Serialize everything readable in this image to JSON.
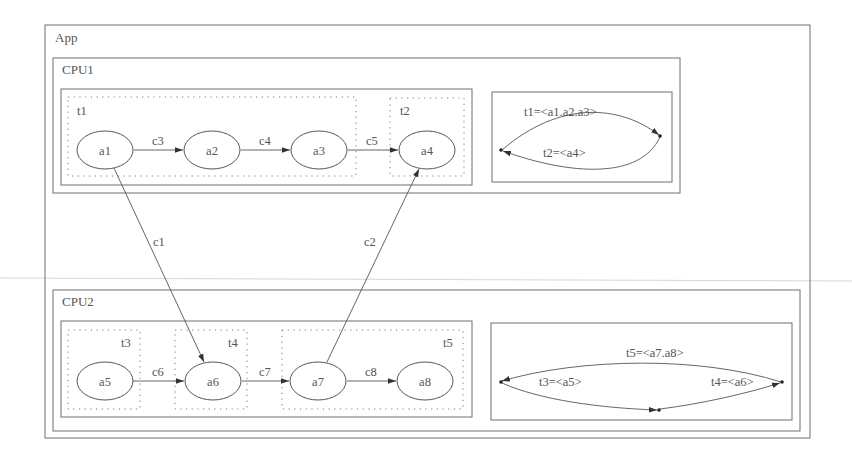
{
  "app": {
    "label": "App"
  },
  "cpus": [
    {
      "label": "CPU1",
      "tasks": [
        {
          "label": "t1"
        },
        {
          "label": "t2"
        }
      ],
      "schedule": {
        "edges": [
          {
            "label": "t1=<a1.a2.a3>"
          },
          {
            "label": "t2=<a4>"
          }
        ]
      }
    },
    {
      "label": "CPU2",
      "tasks": [
        {
          "label": "t3"
        },
        {
          "label": "t4"
        },
        {
          "label": "t5"
        }
      ],
      "schedule": {
        "edges": [
          {
            "label": "t5=<a7.a8>"
          },
          {
            "label": "t3=<a5>"
          },
          {
            "label": "t4=<a6>"
          }
        ]
      }
    }
  ],
  "actors": {
    "a1": "a1",
    "a2": "a2",
    "a3": "a3",
    "a4": "a4",
    "a5": "a5",
    "a6": "a6",
    "a7": "a7",
    "a8": "a8"
  },
  "channels": {
    "c1": "c1",
    "c2": "c2",
    "c3": "c3",
    "c4": "c4",
    "c5": "c5",
    "c6": "c6",
    "c7": "c7",
    "c8": "c8"
  },
  "colors": {
    "stroke": "#555555",
    "frame": "#6e6e6e",
    "background": "#ffffff"
  }
}
